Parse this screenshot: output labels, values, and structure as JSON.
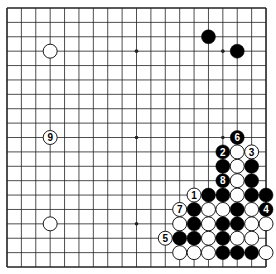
{
  "diagram": {
    "type": "go-board",
    "size": 19,
    "origin": {
      "x": 7,
      "y": 8
    },
    "spacing": 14.39,
    "stone_radius": 7,
    "colors": {
      "background": "#ffffff",
      "grid": "#222222",
      "black_stone": "#000000",
      "white_stone": "#ffffff",
      "stone_outline": "#000000",
      "label_on_black": "#ffffff",
      "label_on_white": "#000000"
    },
    "star_points": [
      [
        3,
        3
      ],
      [
        9,
        3
      ],
      [
        15,
        3
      ],
      [
        3,
        9
      ],
      [
        9,
        9
      ],
      [
        15,
        9
      ],
      [
        3,
        15
      ],
      [
        9,
        15
      ],
      [
        15,
        15
      ]
    ],
    "stones": [
      {
        "col": 3,
        "row": 3,
        "color": "white"
      },
      {
        "col": 14,
        "row": 2,
        "color": "black"
      },
      {
        "col": 16,
        "row": 3,
        "color": "black"
      },
      {
        "col": 3,
        "row": 9,
        "color": "white",
        "label": "9"
      },
      {
        "col": 3,
        "row": 15,
        "color": "white"
      },
      {
        "col": 16,
        "row": 9,
        "color": "black",
        "label": "6"
      },
      {
        "col": 15,
        "row": 10,
        "color": "black",
        "label": "2"
      },
      {
        "col": 16,
        "row": 10,
        "color": "white"
      },
      {
        "col": 17,
        "row": 10,
        "color": "white",
        "label": "3"
      },
      {
        "col": 15,
        "row": 11,
        "color": "black"
      },
      {
        "col": 16,
        "row": 11,
        "color": "white"
      },
      {
        "col": 17,
        "row": 11,
        "color": "black"
      },
      {
        "col": 15,
        "row": 12,
        "color": "black",
        "label": "8"
      },
      {
        "col": 16,
        "row": 12,
        "color": "white"
      },
      {
        "col": 17,
        "row": 12,
        "color": "black"
      },
      {
        "col": 13,
        "row": 13,
        "color": "white",
        "label": "1"
      },
      {
        "col": 14,
        "row": 13,
        "color": "black"
      },
      {
        "col": 15,
        "row": 13,
        "color": "black"
      },
      {
        "col": 16,
        "row": 13,
        "color": "white"
      },
      {
        "col": 17,
        "row": 13,
        "color": "black"
      },
      {
        "col": 18,
        "row": 13,
        "color": "black"
      },
      {
        "col": 12,
        "row": 14,
        "color": "white",
        "label": "7"
      },
      {
        "col": 13,
        "row": 14,
        "color": "black"
      },
      {
        "col": 14,
        "row": 14,
        "color": "white"
      },
      {
        "col": 15,
        "row": 14,
        "color": "white"
      },
      {
        "col": 16,
        "row": 14,
        "color": "black"
      },
      {
        "col": 17,
        "row": 14,
        "color": "white"
      },
      {
        "col": 18,
        "row": 14,
        "color": "black",
        "label": "4"
      },
      {
        "col": 12,
        "row": 15,
        "color": "white"
      },
      {
        "col": 13,
        "row": 15,
        "color": "black"
      },
      {
        "col": 14,
        "row": 15,
        "color": "white"
      },
      {
        "col": 15,
        "row": 15,
        "color": "black"
      },
      {
        "col": 16,
        "row": 15,
        "color": "black"
      },
      {
        "col": 17,
        "row": 15,
        "color": "white"
      },
      {
        "col": 18,
        "row": 15,
        "color": "white"
      },
      {
        "col": 11,
        "row": 16,
        "color": "white",
        "label": "5"
      },
      {
        "col": 12,
        "row": 16,
        "color": "black"
      },
      {
        "col": 13,
        "row": 16,
        "color": "black"
      },
      {
        "col": 14,
        "row": 16,
        "color": "white"
      },
      {
        "col": 15,
        "row": 16,
        "color": "black"
      },
      {
        "col": 16,
        "row": 16,
        "color": "white"
      },
      {
        "col": 17,
        "row": 16,
        "color": "white"
      },
      {
        "col": 12,
        "row": 17,
        "color": "white"
      },
      {
        "col": 13,
        "row": 17,
        "color": "white"
      },
      {
        "col": 14,
        "row": 17,
        "color": "white"
      },
      {
        "col": 15,
        "row": 17,
        "color": "black"
      },
      {
        "col": 16,
        "row": 17,
        "color": "black"
      },
      {
        "col": 17,
        "row": 17,
        "color": "black"
      },
      {
        "col": 18,
        "row": 17,
        "color": "white"
      }
    ]
  }
}
